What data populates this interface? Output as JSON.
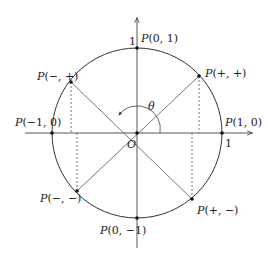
{
  "diagram": {
    "type": "unit-circle",
    "origin_label": "O",
    "angle_label": "θ",
    "tick_x": "1",
    "tick_y": "1",
    "points": {
      "pos_x_axis": {
        "P": "P",
        "coords": "(1, 0)"
      },
      "neg_x_axis": {
        "P": "P",
        "coords": "(−1, 0)"
      },
      "pos_y_axis": {
        "P": "P",
        "coords": "(0, 1)"
      },
      "neg_y_axis": {
        "P": "P",
        "coords": "(0, −1)"
      },
      "quadrant_1": {
        "P": "P",
        "coords": "(+, +)"
      },
      "quadrant_2": {
        "P": "P",
        "coords": "(−, +)"
      },
      "quadrant_3": {
        "P": "P",
        "coords": "(−, −)"
      },
      "quadrant_4": {
        "P": "P",
        "coords": "(+, −)"
      }
    },
    "colors": {
      "stroke": "#333333",
      "dashed": "#555555"
    }
  }
}
